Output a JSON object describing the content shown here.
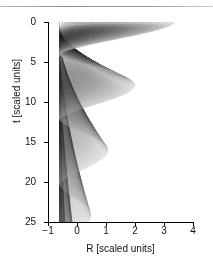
{
  "chart_data": {
    "type": "line",
    "title": "",
    "xlabel": "R [scaled units]",
    "ylabel": "t [scaled units]",
    "xlim": [
      -1,
      4
    ],
    "ylim": [
      0,
      25
    ],
    "y_inverted": true,
    "xticks": [
      -1,
      0,
      1,
      2,
      3,
      4
    ],
    "xtick_labels": [
      "−1",
      "0",
      "1",
      "2",
      "3",
      "4"
    ],
    "yticks": [
      0,
      5,
      10,
      15,
      20,
      25
    ],
    "ytick_labels": [
      "0",
      "5",
      "10",
      "15",
      "20",
      "25"
    ],
    "grid": false,
    "legend": false,
    "line_color": "#303030",
    "series_count": 150,
    "left_turning_point": -0.6,
    "max_initial_radius": 3.4,
    "cusp": {
      "R": 1.1,
      "t": 2.9
    },
    "damping_per_period": 0.62,
    "period_base": 7.0,
    "series": [
      {
        "name": "trajectory-envelope-outer",
        "R0": 3.4,
        "t_start": 0.0
      },
      {
        "name": "trajectory-envelope-inner",
        "R0": 0.1,
        "t_start": 0.0
      }
    ]
  }
}
